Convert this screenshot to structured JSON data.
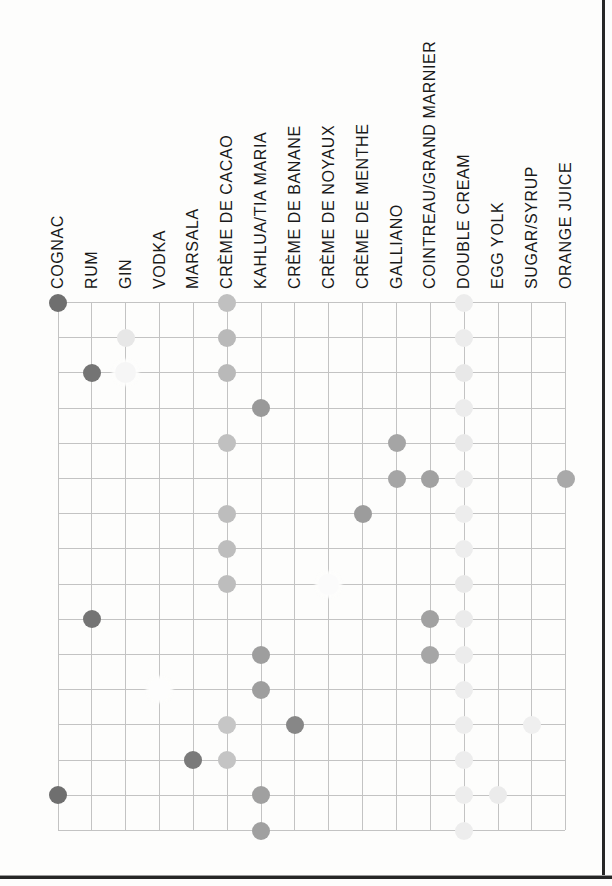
{
  "page": {
    "background": "#fdfdfc",
    "frame_color": "#262626",
    "grid_line_color": "#c3c3c3",
    "label_color": "#191919"
  },
  "chart_data": {
    "type": "heatmap",
    "subtype": "matrix-dot-chart",
    "columns": [
      "COGNAC",
      "RUM",
      "GIN",
      "VODKA",
      "MARSALA",
      "CRÈME DE CACAO",
      "KAHLUA/TIA MARIA",
      "CRÈME DE BANANE",
      "CRÈME DE NOYAUX",
      "CRÈME DE MENTHE",
      "GALLIANO",
      "COINTREAU/GRAND MARNIER",
      "DOUBLE CREAM",
      "EGG YOLK",
      "SUGAR/SYRUP",
      "ORANGE JUICE"
    ],
    "row_count": 16,
    "row_labels": [],
    "legend": "none",
    "grid": true,
    "dots": [
      {
        "row": 1,
        "col": "COGNAC",
        "shade": "#6f6f6f",
        "halo": false
      },
      {
        "row": 1,
        "col": "CRÈME DE CACAO",
        "shade": "#c0c0c0",
        "halo": false
      },
      {
        "row": 1,
        "col": "DOUBLE CREAM",
        "shade": "#ececec",
        "halo": false
      },
      {
        "row": 2,
        "col": "GIN",
        "shade": "#e7e7e7",
        "halo": false
      },
      {
        "row": 2,
        "col": "CRÈME DE CACAO",
        "shade": "#b9b9b9",
        "halo": false
      },
      {
        "row": 2,
        "col": "DOUBLE CREAM",
        "shade": "#ececec",
        "halo": false
      },
      {
        "row": 3,
        "col": "RUM",
        "shade": "#747474",
        "halo": false
      },
      {
        "row": 3,
        "col": "GIN",
        "shade": "#f6f6f6",
        "halo": true
      },
      {
        "row": 3,
        "col": "CRÈME DE CACAO",
        "shade": "#b9b9b9",
        "halo": false
      },
      {
        "row": 3,
        "col": "DOUBLE CREAM",
        "shade": "#e8e8e8",
        "halo": false
      },
      {
        "row": 4,
        "col": "KAHLUA/TIA MARIA",
        "shade": "#999999",
        "halo": false
      },
      {
        "row": 4,
        "col": "DOUBLE CREAM",
        "shade": "#ececec",
        "halo": false
      },
      {
        "row": 5,
        "col": "CRÈME DE CACAO",
        "shade": "#c0c0c0",
        "halo": false
      },
      {
        "row": 5,
        "col": "GALLIANO",
        "shade": "#a5a5a5",
        "halo": false
      },
      {
        "row": 5,
        "col": "DOUBLE CREAM",
        "shade": "#e9e9e9",
        "halo": false
      },
      {
        "row": 6,
        "col": "GALLIANO",
        "shade": "#a5a5a5",
        "halo": false
      },
      {
        "row": 6,
        "col": "COINTREAU/GRAND MARNIER",
        "shade": "#a1a1a1",
        "halo": false
      },
      {
        "row": 6,
        "col": "DOUBLE CREAM",
        "shade": "#ececec",
        "halo": false
      },
      {
        "row": 6,
        "col": "ORANGE JUICE",
        "shade": "#a9a9a9",
        "halo": false
      },
      {
        "row": 7,
        "col": "CRÈME DE CACAO",
        "shade": "#bdbdbd",
        "halo": false
      },
      {
        "row": 7,
        "col": "CRÈME DE MENTHE",
        "shade": "#9c9c9c",
        "halo": false
      },
      {
        "row": 7,
        "col": "DOUBLE CREAM",
        "shade": "#ededed",
        "halo": false
      },
      {
        "row": 8,
        "col": "CRÈME DE CACAO",
        "shade": "#bdbdbd",
        "halo": false
      },
      {
        "row": 8,
        "col": "DOUBLE CREAM",
        "shade": "#ededed",
        "halo": false
      },
      {
        "row": 9,
        "col": "CRÈME DE CACAO",
        "shade": "#bdbdbd",
        "halo": false
      },
      {
        "row": 9,
        "col": "CRÈME DE NOYAUX",
        "shade": "#fbfbfb",
        "halo": true
      },
      {
        "row": 9,
        "col": "DOUBLE CREAM",
        "shade": "#e9e9e9",
        "halo": false
      },
      {
        "row": 10,
        "col": "RUM",
        "shade": "#747474",
        "halo": false
      },
      {
        "row": 10,
        "col": "COINTREAU/GRAND MARNIER",
        "shade": "#a1a1a1",
        "halo": false
      },
      {
        "row": 10,
        "col": "DOUBLE CREAM",
        "shade": "#ebebeb",
        "halo": false
      },
      {
        "row": 11,
        "col": "KAHLUA/TIA MARIA",
        "shade": "#9e9e9e",
        "halo": false
      },
      {
        "row": 11,
        "col": "COINTREAU/GRAND MARNIER",
        "shade": "#a6a6a6",
        "halo": false
      },
      {
        "row": 11,
        "col": "DOUBLE CREAM",
        "shade": "#ececec",
        "halo": false
      },
      {
        "row": 12,
        "col": "VODKA",
        "shade": "#fdfdfd",
        "halo": true
      },
      {
        "row": 12,
        "col": "KAHLUA/TIA MARIA",
        "shade": "#9e9e9e",
        "halo": false
      },
      {
        "row": 12,
        "col": "DOUBLE CREAM",
        "shade": "#ededed",
        "halo": false
      },
      {
        "row": 13,
        "col": "CRÈME DE CACAO",
        "shade": "#c6c6c6",
        "halo": false
      },
      {
        "row": 13,
        "col": "CRÈME DE BANANE",
        "shade": "#878787",
        "halo": false
      },
      {
        "row": 13,
        "col": "DOUBLE CREAM",
        "shade": "#ededed",
        "halo": false
      },
      {
        "row": 13,
        "col": "SUGAR/SYRUP",
        "shade": "#efefef",
        "halo": false
      },
      {
        "row": 14,
        "col": "MARSALA",
        "shade": "#7a7a7a",
        "halo": false
      },
      {
        "row": 14,
        "col": "CRÈME DE CACAO",
        "shade": "#c4c4c4",
        "halo": false
      },
      {
        "row": 14,
        "col": "DOUBLE CREAM",
        "shade": "#ededed",
        "halo": false
      },
      {
        "row": 15,
        "col": "COGNAC",
        "shade": "#6f6f6f",
        "halo": false
      },
      {
        "row": 15,
        "col": "KAHLUA/TIA MARIA",
        "shade": "#a0a0a0",
        "halo": false
      },
      {
        "row": 15,
        "col": "DOUBLE CREAM",
        "shade": "#ededed",
        "halo": false
      },
      {
        "row": 15,
        "col": "EGG YOLK",
        "shade": "#ebebeb",
        "halo": false
      },
      {
        "row": 16,
        "col": "KAHLUA/TIA MARIA",
        "shade": "#a0a0a0",
        "halo": false
      },
      {
        "row": 16,
        "col": "DOUBLE CREAM",
        "shade": "#ededed",
        "halo": false
      }
    ]
  }
}
